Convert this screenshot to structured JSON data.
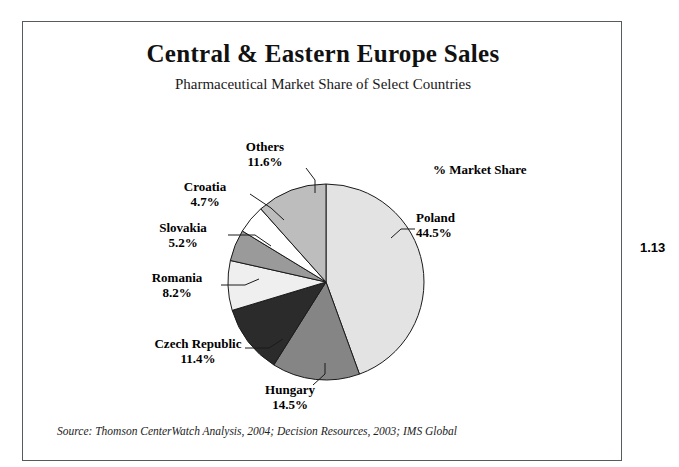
{
  "figure": {
    "title": "Central & Eastern Europe Sales",
    "subtitle": "Pharmaceutical Market Share of Select Countries",
    "caption": "% Market Share",
    "source": "Source: Thomson CenterWatch Analysis, 2004; Decision Resources, 2003; IMS Global",
    "page_number": "1.13",
    "frame_color": "#555b5e"
  },
  "chart_data": {
    "type": "pie",
    "title": "Central & Eastern Europe Sales",
    "subtitle": "Pharmaceutical Market Share of Select Countries",
    "value_label": "% Market Share",
    "units": "percent",
    "start_angle_deg": 0,
    "direction": "clockwise",
    "total": 100.1,
    "categories": [
      "Poland",
      "Hungary",
      "Czech Republic",
      "Romania",
      "Slovakia",
      "Croatia",
      "Others"
    ],
    "values": [
      44.5,
      14.5,
      11.4,
      8.2,
      5.2,
      4.7,
      11.6
    ],
    "slices": [
      {
        "label": "Poland",
        "value": 44.5,
        "value_text": "44.5%",
        "color": "#e3e3e3"
      },
      {
        "label": "Hungary",
        "value": 14.5,
        "value_text": "14.5%",
        "color": "#858585"
      },
      {
        "label": "Czech Republic",
        "value": 11.4,
        "value_text": "11.4%",
        "color": "#2b2b2b"
      },
      {
        "label": "Romania",
        "value": 8.2,
        "value_text": "8.2%",
        "color": "#efefef"
      },
      {
        "label": "Slovakia",
        "value": 5.2,
        "value_text": "5.2%",
        "color": "#9a9a9a"
      },
      {
        "label": "Croatia",
        "value": 4.7,
        "value_text": "4.7%",
        "color": "#ffffff"
      },
      {
        "label": "Others",
        "value": 11.6,
        "value_text": "11.6%",
        "color": "#bdbdbd"
      }
    ],
    "legend": "labels-outside-with-leader-lines",
    "grid": false
  },
  "labels": {
    "poland": {
      "name": "Poland",
      "value": "44.5%"
    },
    "hungary": {
      "name": "Hungary",
      "value": "14.5%"
    },
    "czech": {
      "name": "Czech Republic",
      "value": "11.4%"
    },
    "romania": {
      "name": "Romania",
      "value": "8.2%"
    },
    "slovakia": {
      "name": "Slovakia",
      "value": "5.2%"
    },
    "croatia": {
      "name": "Croatia",
      "value": "4.7%"
    },
    "others": {
      "name": "Others",
      "value": "11.6%"
    }
  }
}
